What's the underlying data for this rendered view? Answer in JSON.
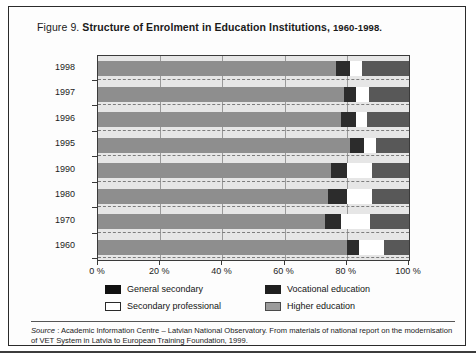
{
  "figure": {
    "label": "Figure 9.",
    "title": "Structure of Enrolment in Education Institutions,",
    "years": "1960-1998."
  },
  "source": {
    "word": "Source",
    "text": " : Academic Information Centre – Latvian National Observatory. From materials of national report on the modernisation of VET System in Latvia to European Training Foundation, 1999."
  },
  "legend": {
    "items": [
      {
        "label": "General secondary",
        "key": "general",
        "color": "#111111"
      },
      {
        "label": "Vocational education",
        "key": "vocational",
        "color": "#1f1f1f"
      },
      {
        "label": "Secondary professional",
        "key": "secprof",
        "color": "#ffffff"
      },
      {
        "label": "Higher education",
        "key": "higher",
        "color": "#9b9b9b"
      }
    ]
  },
  "chart_data": {
    "type": "bar",
    "orientation": "horizontal",
    "stacked": true,
    "stack_mode": "percent",
    "title": "Structure of Enrolment in Education Institutions, 1960-1998.",
    "xlabel": "",
    "ylabel": "",
    "xlim": [
      0,
      100
    ],
    "xticks": [
      0,
      20,
      40,
      60,
      80,
      100
    ],
    "xtick_labels": [
      "0 %",
      "20 %",
      "40 %",
      "60 %",
      "80 %",
      "100 %"
    ],
    "grid": true,
    "legend_position": "bottom",
    "categories": [
      "1998",
      "1997",
      "1996",
      "1995",
      "1990",
      "1980",
      "1970",
      "1960"
    ],
    "series": [
      {
        "name": "General secondary",
        "values": [
          76.5,
          79.0,
          78.0,
          81.0,
          75.0,
          74.0,
          73.0,
          80.0
        ]
      },
      {
        "name": "Vocational education",
        "values": [
          4.5,
          4.0,
          5.0,
          4.5,
          5.0,
          6.0,
          5.0,
          4.0
        ]
      },
      {
        "name": "Secondary professional",
        "values": [
          4.0,
          4.0,
          3.5,
          4.0,
          8.0,
          8.0,
          9.5,
          8.0
        ]
      },
      {
        "name": "Higher education",
        "values": [
          15.0,
          13.0,
          13.5,
          10.5,
          12.0,
          12.0,
          12.5,
          8.0
        ]
      }
    ]
  }
}
